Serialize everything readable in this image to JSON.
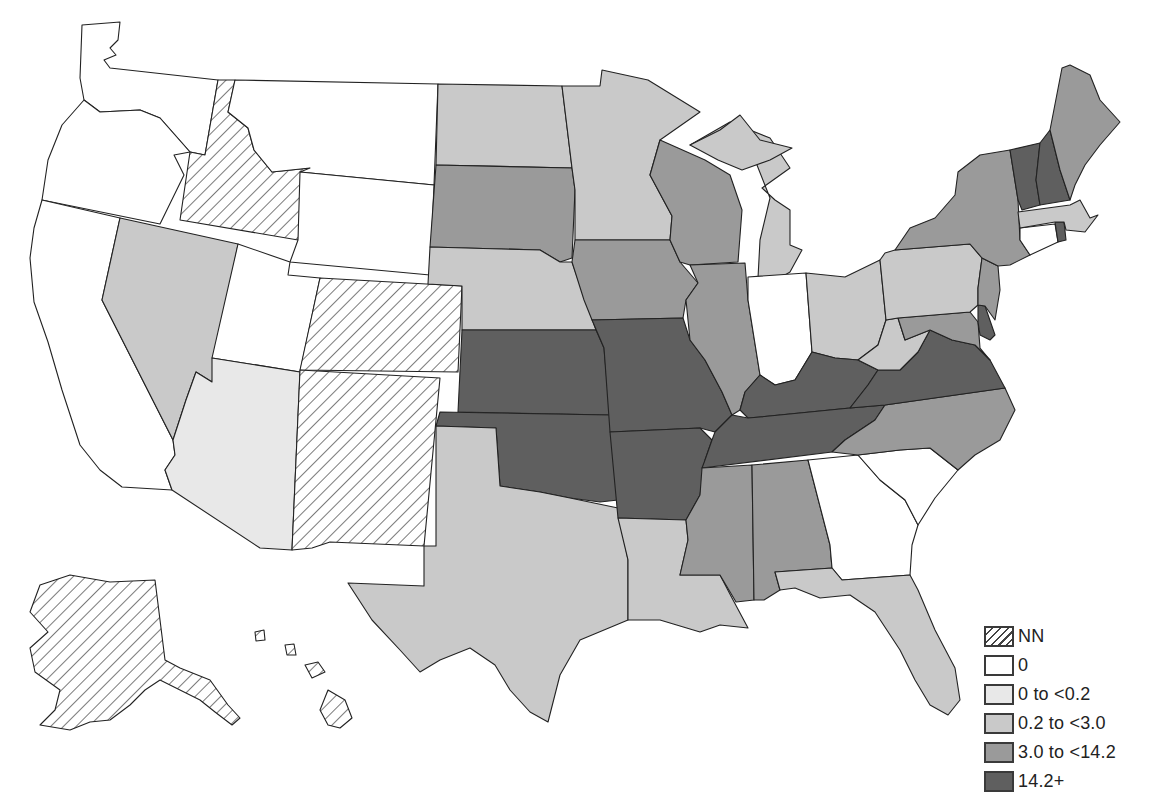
{
  "legend": {
    "items": [
      {
        "key": "NN",
        "label": "NN",
        "fill": "hatch"
      },
      {
        "key": "0",
        "label": "0",
        "fill": "#ffffff"
      },
      {
        "key": "lt0.2",
        "label": "0 to <0.2",
        "fill": "#e8e8e8"
      },
      {
        "key": "lt3.0",
        "label": "0.2 to <3.0",
        "fill": "#c9c9c9"
      },
      {
        "key": "lt14.2",
        "label": "3.0 to <14.2",
        "fill": "#9a9a9a"
      },
      {
        "key": "ge14.2",
        "label": "14.2+",
        "fill": "#5f5f5f"
      }
    ]
  },
  "states": {
    "WA": "0",
    "OR": "0",
    "CA": "0",
    "MT": "0",
    "WY": "0",
    "UT": "0",
    "ID": "NN",
    "CO": "NN",
    "NM": "NN",
    "AK": "NN",
    "HI": "NN",
    "NV": "lt3.0",
    "AZ": "lt0.2",
    "ND": "lt3.0",
    "MN": "lt3.0",
    "NE": "lt3.0",
    "MI": "lt3.0",
    "TX": "lt3.0",
    "LA": "lt3.0",
    "OH": "lt3.0",
    "PA": "lt3.0",
    "WV": "lt3.0",
    "FL": "lt3.0",
    "MA": "lt3.0",
    "SD": "lt14.2",
    "IA": "lt14.2",
    "WI": "lt14.2",
    "IL": "lt14.2",
    "MS": "lt14.2",
    "AL": "lt14.2",
    "NC": "lt14.2",
    "NY": "lt14.2",
    "NJ": "lt14.2",
    "MD": "lt14.2",
    "ME": "lt14.2",
    "KS": "ge14.2",
    "MO": "ge14.2",
    "OK": "ge14.2",
    "AR": "ge14.2",
    "KY": "ge14.2",
    "TN": "ge14.2",
    "VA": "ge14.2",
    "VT": "ge14.2",
    "NH": "ge14.2",
    "DE": "ge14.2",
    "RI": "ge14.2",
    "IN": "0",
    "GA": "0",
    "SC": "0",
    "CT": "0"
  }
}
